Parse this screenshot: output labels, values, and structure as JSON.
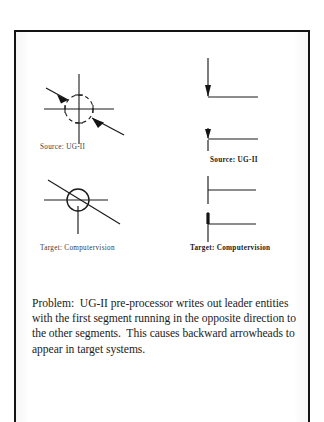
{
  "slide": {
    "figures": [
      {
        "id": "source-ug2-left",
        "caption": "Source:  UG-II",
        "caption_style": "light",
        "diagram_name": "leader-crosshair-backward-arrowheads",
        "description": "Crosshair target symbol with two leader lines whose arrowheads point inward toward the centre"
      },
      {
        "id": "source-ug2-right",
        "caption": "Source:  UG-II",
        "caption_style": "bold",
        "diagram_name": "leader-vertical-arrow-to-horizontal-shelf",
        "description": "Two vertical leader lines with arrowheads terminating at a horizontal shelf line"
      },
      {
        "id": "target-computervision-left",
        "caption": "Target:  Computervision",
        "caption_style": "light",
        "diagram_name": "leader-circle-backward-arrowhead",
        "description": "Circle symbol crossed by horizontal, vertical and diagonal leader lines"
      },
      {
        "id": "target-computervision-right",
        "caption": "Target:  Computervision",
        "caption_style": "bold",
        "diagram_name": "leader-plus-cross-no-arrowhead",
        "description": "Two plus-shaped crosses formed by a vertical line meeting a horizontal leader line"
      }
    ],
    "problem": {
      "label": "Problem:",
      "text": "Problem:  UG-II pre-processor writes out leader entities with the first segment running in the opposite direction to the other segments.  This causes backward arrowheads to appear in target systems."
    },
    "colors": {
      "ink": "#1c1c1c",
      "frame": "#141414",
      "paper": "#ffffff",
      "caption": "#3a3a3a"
    }
  }
}
